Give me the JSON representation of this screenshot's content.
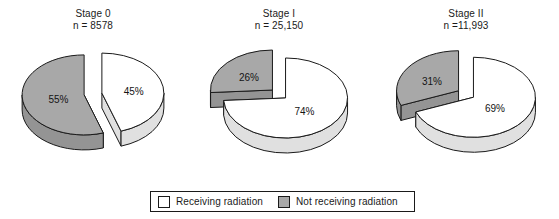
{
  "chart_data": {
    "type": "pie",
    "title": "",
    "subtitle": "",
    "panel_layout": "three pie charts side by side, legend centered below",
    "legend": {
      "position": "bottom-center",
      "entries": [
        {
          "label": "Receiving radiation",
          "color": "#ffffff"
        },
        {
          "label": "Not receiving radiation",
          "color": "#a8a8a8"
        }
      ]
    },
    "style": {
      "three_d": true,
      "exploded": true,
      "outline_color": "#1a1a1a",
      "background": "#ffffff",
      "side_wall_color": "#9a9a9a"
    },
    "panels": [
      {
        "title": "Stage 0",
        "n_label": "n = 8578",
        "n_value": 8578,
        "categories": [
          "Receiving radiation",
          "Not receiving radiation"
        ],
        "values": [
          45,
          55
        ],
        "labels": [
          "45%",
          "55%"
        ],
        "colors": [
          "#ffffff",
          "#a8a8a8"
        ]
      },
      {
        "title": "Stage I",
        "n_label": "n = 25,150",
        "n_value": 25150,
        "categories": [
          "Receiving radiation",
          "Not receiving radiation"
        ],
        "values": [
          74,
          26
        ],
        "labels": [
          "74%",
          "26%"
        ],
        "colors": [
          "#ffffff",
          "#a8a8a8"
        ]
      },
      {
        "title": "Stage II",
        "n_label": "n =11,993",
        "n_value": 11993,
        "categories": [
          "Receiving radiation",
          "Not receiving radiation"
        ],
        "values": [
          69,
          31
        ],
        "labels": [
          "69%",
          "31%"
        ],
        "colors": [
          "#ffffff",
          "#a8a8a8"
        ]
      }
    ]
  }
}
